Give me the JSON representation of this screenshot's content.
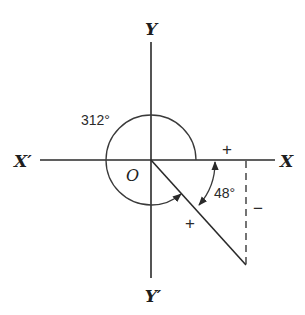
{
  "diagram": {
    "axes": {
      "x_positive_label": "X",
      "x_negative_label": "X′",
      "y_positive_label": "Y",
      "y_negative_label": "Y′",
      "origin_label": "O"
    },
    "angles": {
      "large_angle_label": "312°",
      "reference_angle_label": "48°"
    },
    "signs": {
      "x_segment_sign": "+",
      "y_segment_sign": "−",
      "terminal_side_sign": "+"
    },
    "colors": {
      "stroke": "#2a2a2a",
      "background": "#ffffff"
    }
  }
}
